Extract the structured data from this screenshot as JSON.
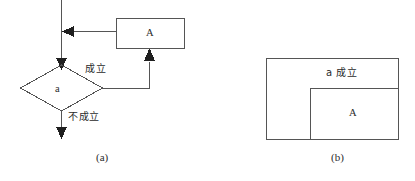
{
  "figure": {
    "caption_a": "(a)",
    "caption_b": "(b)",
    "stroke_color": "#555555",
    "text_color": "#2b2b2b",
    "background_color": "#ffffff"
  },
  "flowchart": {
    "title_ref": "(a)",
    "decision_node": {
      "label": "a",
      "shape": "diamond",
      "center_x": 61,
      "center_y": 88,
      "half_width": 41,
      "half_height": 23
    },
    "process_box": {
      "label": "A",
      "shape": "rectangle",
      "x": 116,
      "y": 18,
      "width": 68,
      "height": 30
    },
    "branches": [
      {
        "name": "true-branch",
        "label": "成立",
        "from": "decision-node",
        "to": "process-box-a"
      },
      {
        "name": "false-branch",
        "label": "不成立",
        "from": "decision-node",
        "to": "exit"
      }
    ],
    "entry_arrow": {
      "name": "entry",
      "direction": "down"
    },
    "loop_back_arrow": {
      "name": "loop-back",
      "direction": "left"
    }
  },
  "region_diagram": {
    "title_ref": "(b)",
    "outer_region": {
      "label": "a 成立",
      "x": 266,
      "y": 58,
      "width": 132,
      "height": 82
    },
    "inner_region": {
      "label": "A",
      "x": 310,
      "y": 88,
      "width": 88,
      "height": 52
    }
  }
}
